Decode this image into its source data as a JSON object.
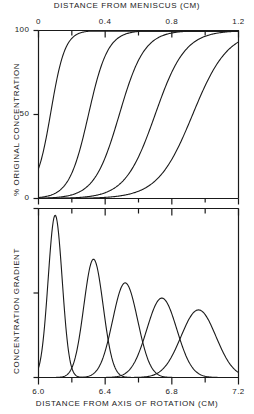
{
  "figure": {
    "top_axis_title": "DISTANCE  FROM  MENISCUS (CM)",
    "bottom_axis_title": "DISTANCE  FROM  AXIS  OF  ROTATION  (CM)",
    "upper_ylabel": "% ORIGINAL  CONCENTRATION",
    "lower_ylabel": "CONCENTRATION  GRADIENT",
    "line_color": "#1a1a1a",
    "background_color": "#ffffff"
  },
  "upper_panel": {
    "y_ticks": [
      {
        "value": 0,
        "label": "0"
      },
      {
        "value": 50,
        "label": "50"
      },
      {
        "value": 100,
        "label": "100"
      }
    ],
    "x_ticks": [
      {
        "value": 0.0,
        "label": "0"
      },
      {
        "value": 0.2,
        "label": ""
      },
      {
        "value": 0.4,
        "label": "0.4"
      },
      {
        "value": 0.6,
        "label": ""
      },
      {
        "value": 0.8,
        "label": "0.8"
      },
      {
        "value": 1.0,
        "label": ""
      },
      {
        "value": 1.2,
        "label": "1.2"
      }
    ]
  },
  "lower_panel": {
    "x_ticks": [
      {
        "value": 6.0,
        "label": "6.0"
      },
      {
        "value": 6.2,
        "label": ""
      },
      {
        "value": 6.4,
        "label": "6.4"
      },
      {
        "value": 6.6,
        "label": ""
      },
      {
        "value": 6.8,
        "label": "6.8"
      },
      {
        "value": 7.0,
        "label": ""
      },
      {
        "value": 7.2,
        "label": "7.2"
      }
    ],
    "y_ticks": [
      {
        "value": 1.0,
        "label": ""
      },
      {
        "value": 0.5,
        "label": ""
      },
      {
        "value": 0.0,
        "label": ""
      }
    ]
  },
  "chart_data": {
    "type": "line",
    "title": "",
    "subtitle": "",
    "panels": [
      {
        "name": "upper",
        "xlabel": "DISTANCE  FROM  MENISCUS (CM)",
        "ylabel": "% ORIGINAL  CONCENTRATION",
        "xlim": [
          0.0,
          1.2
        ],
        "ylim": [
          0,
          100
        ],
        "xticks": [
          0.0,
          0.2,
          0.4,
          0.6,
          0.8,
          1.0,
          1.2
        ],
        "xticklabels": [
          "0",
          "",
          "0.4",
          "",
          "0.8",
          "",
          "1.2"
        ],
        "yticks": [
          0,
          50,
          100
        ],
        "yticklabels": [
          "0",
          "50",
          "100"
        ],
        "grid": false,
        "legend": "none",
        "series": [
          {
            "name": "curve-1",
            "midpoint": 0.075,
            "width": 0.042,
            "plateau": 100,
            "baseline": 4
          },
          {
            "name": "curve-2",
            "midpoint": 0.3,
            "width": 0.058,
            "plateau": 100,
            "baseline": 0
          },
          {
            "name": "curve-3",
            "midpoint": 0.485,
            "width": 0.075,
            "plateau": 100,
            "baseline": 0
          },
          {
            "name": "curve-4",
            "midpoint": 0.7,
            "width": 0.09,
            "plateau": 100,
            "baseline": 0
          },
          {
            "name": "curve-5",
            "midpoint": 0.925,
            "width": 0.105,
            "plateau": 100,
            "baseline": 0
          }
        ]
      },
      {
        "name": "lower",
        "xlabel": "DISTANCE  FROM  AXIS  OF  ROTATION  (CM)",
        "ylabel": "CONCENTRATION  GRADIENT",
        "xlim": [
          6.0,
          7.2
        ],
        "ylim": [
          0,
          1.0
        ],
        "xticks": [
          6.0,
          6.2,
          6.4,
          6.6,
          6.8,
          7.0,
          7.2
        ],
        "xticklabels": [
          "6.0",
          "",
          "6.4",
          "",
          "6.8",
          "",
          "7.2"
        ],
        "yticks": [
          0.0,
          0.5,
          1.0
        ],
        "yticklabels": [
          "",
          "",
          ""
        ],
        "grid": false,
        "legend": "none",
        "series": [
          {
            "name": "peak-1",
            "center": 6.1,
            "height": 0.96,
            "sigma": 0.042
          },
          {
            "name": "peak-2",
            "center": 6.33,
            "height": 0.7,
            "sigma": 0.058
          },
          {
            "name": "peak-3",
            "center": 6.52,
            "height": 0.56,
            "sigma": 0.075
          },
          {
            "name": "peak-4",
            "center": 6.74,
            "height": 0.47,
            "sigma": 0.09
          },
          {
            "name": "peak-5",
            "center": 6.96,
            "height": 0.4,
            "sigma": 0.105
          }
        ]
      }
    ]
  }
}
